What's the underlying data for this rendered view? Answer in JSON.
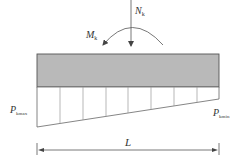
{
  "diagram": {
    "colors": {
      "beam_fill": "#b9b9b9",
      "line": "#555555",
      "light_line": "#9a9a9a",
      "text": "#333333"
    },
    "loads": {
      "axial": {
        "symbol": "N",
        "subscript": "k"
      },
      "moment": {
        "symbol": "M",
        "subscript": "k"
      }
    },
    "pressure": {
      "left": {
        "symbol": "P",
        "subscript": "kmax"
      },
      "right": {
        "symbol": "P",
        "subscript": "kmin"
      },
      "divisions": 8
    },
    "dimension": {
      "label": "L"
    }
  }
}
